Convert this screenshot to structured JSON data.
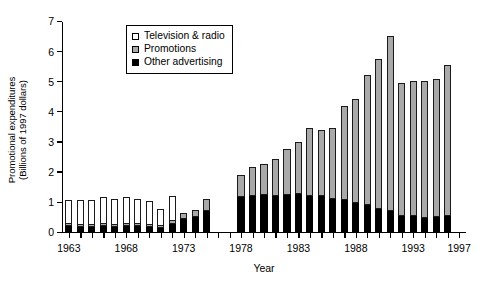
{
  "chart_data": {
    "type": "bar",
    "subtype": "stacked-bar",
    "title": "",
    "xlabel": "Year",
    "ylabel": "Promotional expenditures (Billions of 1997 dollars)",
    "ylabel_line1": "Promotional expenditures",
    "ylabel_line2": "(Billions of 1997 dollars)",
    "ylim": [
      0,
      7
    ],
    "ytick_values": [
      0,
      1,
      2,
      3,
      4,
      5,
      6,
      7
    ],
    "ytick_labels": [
      "0",
      "1",
      "2",
      "3",
      "4",
      "5",
      "6",
      "7"
    ],
    "xlim": [
      1962.4,
      1997.6
    ],
    "xtick_values": [
      1963,
      1964,
      1965,
      1966,
      1967,
      1968,
      1969,
      1970,
      1971,
      1972,
      1973,
      1974,
      1975,
      1976,
      1977,
      1978,
      1979,
      1980,
      1981,
      1982,
      1983,
      1984,
      1985,
      1986,
      1987,
      1988,
      1989,
      1990,
      1991,
      1992,
      1993,
      1994,
      1995,
      1996,
      1997
    ],
    "xtick_labeled": [
      1963,
      1968,
      1973,
      1978,
      1983,
      1988,
      1993,
      1997
    ],
    "xtick_labels": [
      "1963",
      "1968",
      "1973",
      "1978",
      "1983",
      "1988",
      "1993",
      "1997"
    ],
    "grid": false,
    "legend_position": "upper-left-inside",
    "legend_entries": [
      {
        "name": "Television & radio",
        "color": "#ffffff",
        "edge": "#000000"
      },
      {
        "name": "Promotions",
        "color": "#a9a9a9",
        "edge": "#000000"
      },
      {
        "name": "Other advertising",
        "color": "#000000",
        "edge": "#000000"
      }
    ],
    "categories": [
      1963,
      1964,
      1965,
      1966,
      1967,
      1968,
      1969,
      1970,
      1971,
      1972,
      1973,
      1974,
      1975,
      1978,
      1979,
      1980,
      1981,
      1982,
      1983,
      1984,
      1985,
      1986,
      1987,
      1988,
      1989,
      1990,
      1991,
      1992,
      1993,
      1994,
      1995,
      1996
    ],
    "missing_years": [
      1976,
      1977
    ],
    "series": [
      {
        "name": "Other advertising",
        "color": "#000000",
        "values": [
          0.22,
          0.2,
          0.2,
          0.22,
          0.2,
          0.22,
          0.22,
          0.2,
          0.18,
          0.3,
          0.46,
          0.52,
          0.72,
          1.2,
          1.22,
          1.26,
          1.22,
          1.26,
          1.28,
          1.24,
          1.22,
          1.12,
          1.1,
          1.0,
          0.92,
          0.8,
          0.72,
          0.58,
          0.56,
          0.5,
          0.52,
          0.56
        ]
      },
      {
        "name": "Promotions",
        "color": "#a9a9a9",
        "values": [
          0.1,
          0.1,
          0.1,
          0.1,
          0.1,
          0.1,
          0.1,
          0.1,
          0.1,
          0.12,
          0.22,
          0.26,
          0.42,
          0.72,
          0.96,
          1.04,
          1.24,
          1.54,
          1.74,
          2.26,
          2.2,
          2.36,
          3.12,
          3.44,
          4.32,
          4.96,
          5.82,
          4.4,
          4.48,
          4.54,
          4.58,
          5.02
        ]
      },
      {
        "name": "Television & radio",
        "color": "#ffffff",
        "values": [
          0.78,
          0.8,
          0.78,
          0.86,
          0.82,
          0.88,
          0.82,
          0.76,
          0.52,
          0.8,
          0.0,
          0.0,
          0.0,
          0.0,
          0.0,
          0.0,
          0.0,
          0.0,
          0.0,
          0.0,
          0.0,
          0.0,
          0.0,
          0.0,
          0.0,
          0.0,
          0.0,
          0.0,
          0.0,
          0.0,
          0.0,
          0.0
        ]
      }
    ],
    "totals": [
      1.1,
      1.1,
      1.08,
      1.18,
      1.12,
      1.2,
      1.14,
      1.06,
      0.8,
      1.22,
      0.68,
      0.78,
      1.14,
      1.92,
      2.18,
      2.3,
      2.46,
      2.8,
      3.02,
      3.5,
      3.42,
      3.48,
      4.22,
      4.44,
      5.24,
      5.76,
      6.54,
      4.98,
      5.04,
      5.04,
      5.1,
      5.58
    ]
  }
}
